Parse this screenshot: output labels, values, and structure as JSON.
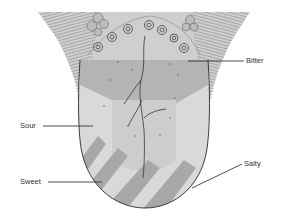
{
  "diagram": {
    "labels": [
      {
        "key": "bitter",
        "text": "Bitter"
      },
      {
        "key": "sour",
        "text": "Sour"
      },
      {
        "key": "sweet",
        "text": "Sweet"
      },
      {
        "key": "salty",
        "text": "Salty"
      }
    ],
    "colors": {
      "background": "#ffffff",
      "bitter_region": "#b4b4b4",
      "sour_region": "#d8d8d8",
      "salty_region": "#d8d8d8",
      "sweet_stripes": "#a8a8a8",
      "tongue_base": "#cfcfcf",
      "outline": "#2a2a2a",
      "leader_line": "#222222",
      "label_text": "#333333"
    }
  }
}
